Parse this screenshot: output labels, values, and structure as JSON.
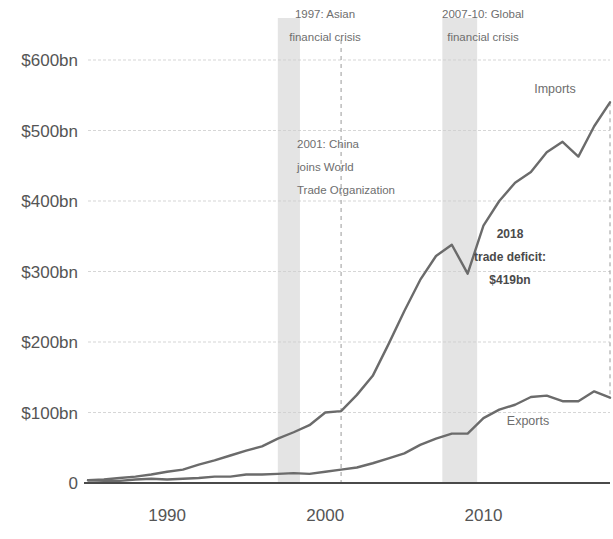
{
  "chart_data": {
    "type": "line",
    "title": "",
    "subtitle": "",
    "xlabel": "",
    "ylabel": "",
    "xlim": [
      1985,
      2018
    ],
    "ylim": [
      0,
      600
    ],
    "grid": true,
    "legend_position": "inline-right",
    "x": [
      1985,
      1986,
      1987,
      1988,
      1989,
      1990,
      1991,
      1992,
      1993,
      1994,
      1995,
      1996,
      1997,
      1998,
      1999,
      2000,
      2001,
      2002,
      2003,
      2004,
      2005,
      2006,
      2007,
      2008,
      2009,
      2010,
      2011,
      2012,
      2013,
      2014,
      2015,
      2016,
      2017,
      2018
    ],
    "x_tick_labels": [
      "1990",
      "2000",
      "2010"
    ],
    "x_ticks": [
      1990,
      2000,
      2010
    ],
    "y_tick_labels": [
      "0",
      "$100bn",
      "$200bn",
      "$300bn",
      "$400bn",
      "$500bn",
      "$600bn"
    ],
    "y_ticks": [
      0,
      100,
      200,
      300,
      400,
      500,
      600
    ],
    "series": [
      {
        "name": "Imports",
        "label": "Imports",
        "color": "#6b6b6b",
        "values": [
          4,
          5,
          7,
          9,
          12,
          16,
          19,
          26,
          32,
          39,
          46,
          52,
          63,
          72,
          82,
          100,
          102,
          125,
          152,
          197,
          244,
          288,
          322,
          338,
          297,
          365,
          400,
          426,
          441,
          469,
          484,
          463,
          506,
          540
        ]
      },
      {
        "name": "Exports",
        "label": "Exports",
        "color": "#6b6b6b",
        "values": [
          4,
          3,
          3,
          5,
          6,
          5,
          6,
          7,
          9,
          9,
          12,
          12,
          13,
          14,
          13,
          16,
          19,
          22,
          28,
          35,
          42,
          54,
          63,
          70,
          70,
          92,
          104,
          111,
          122,
          124,
          116,
          116,
          130,
          121
        ]
      }
    ],
    "bands": [
      {
        "name": "1997 Asian financial crisis",
        "start": 1997,
        "end": 1998.4,
        "color": "#d9d9d9",
        "label_lines": [
          "1997: Asian",
          "financial crisis"
        ]
      },
      {
        "name": "2007-10 Global financial crisis",
        "start": 2007.4,
        "end": 2009.6,
        "color": "#d9d9d9",
        "label_lines": [
          "2007-10: Global",
          "financial crisis"
        ]
      }
    ],
    "vlines": [
      {
        "name": "2001 China joins WTO",
        "x": 2001,
        "label_lines": [
          "2001: China",
          "joins World",
          "Trade Organization"
        ]
      },
      {
        "name": "2018 trade deficit",
        "x": 2018,
        "label_lines": [
          "2018",
          "trade deficit:",
          "$419bn"
        ],
        "bold": true
      }
    ],
    "annotations": [
      {
        "name": "asian-crisis-annotation",
        "lines": [
          "1997: Asian",
          "financial crisis"
        ],
        "x": 325,
        "y": 18,
        "align": "middle",
        "bold": false
      },
      {
        "name": "global-crisis-annotation",
        "lines": [
          "2007-10: Global",
          "financial crisis"
        ],
        "x": 483,
        "y": 18,
        "align": "middle",
        "bold": false
      },
      {
        "name": "wto-annotation",
        "lines": [
          "2001: China",
          "joins World",
          "Trade Organization"
        ],
        "x": 297,
        "y": 148,
        "align": "start",
        "bold": false
      },
      {
        "name": "trade-deficit-annotation",
        "lines": [
          "2018",
          "trade deficit:",
          "$419bn"
        ],
        "x": 510,
        "y": 238,
        "align": "middle",
        "bold": true
      }
    ],
    "series_labels": [
      {
        "name": "imports-series-label",
        "text": "Imports",
        "x": 555,
        "y": 93
      },
      {
        "name": "exports-series-label",
        "text": "Exports",
        "x": 528,
        "y": 425
      }
    ]
  }
}
